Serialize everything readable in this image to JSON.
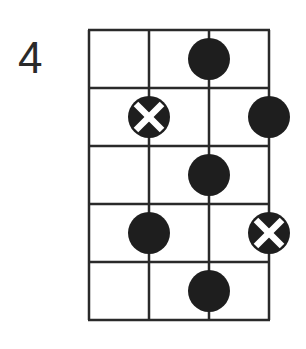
{
  "diagram": {
    "fret_label": "4",
    "strings": 4,
    "frets": 5,
    "grid": {
      "x": [
        89,
        149,
        209,
        269
      ],
      "y": [
        30,
        88,
        146,
        204,
        262,
        320
      ]
    },
    "line_color": "#2a2a2a",
    "dot_color": "#1e1e1e",
    "x_mark_color": "#ffffff",
    "dot_radius": 21,
    "notes": [
      {
        "fret": 1,
        "string": 3,
        "type": "dot"
      },
      {
        "fret": 2,
        "string": 2,
        "type": "x"
      },
      {
        "fret": 2,
        "string": 4,
        "type": "dot"
      },
      {
        "fret": 3,
        "string": 3,
        "type": "dot"
      },
      {
        "fret": 4,
        "string": 2,
        "type": "dot"
      },
      {
        "fret": 4,
        "string": 4,
        "type": "x"
      },
      {
        "fret": 5,
        "string": 3,
        "type": "dot"
      }
    ]
  }
}
